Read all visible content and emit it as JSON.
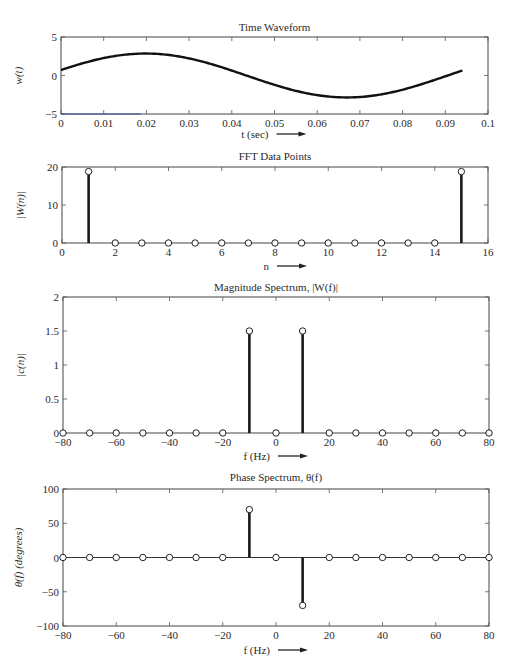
{
  "chart_data": [
    {
      "type": "line",
      "title": "Time Waveform",
      "xlabel": "t (sec)",
      "ylabel": "w(t)",
      "xlim": [
        0,
        0.1
      ],
      "ylim": [
        -5,
        5
      ],
      "xticks": [
        "0",
        "0.01",
        "0.02",
        "0.03",
        "0.04",
        "0.05",
        "0.06",
        "0.07",
        "0.08",
        "0.09",
        "0.1"
      ],
      "yticks": [
        "5",
        "0",
        "−5"
      ],
      "series": [
        {
          "name": "w(t)",
          "x": [
            0,
            0.005,
            0.01,
            0.015,
            0.02,
            0.025,
            0.03,
            0.035,
            0.04,
            0.045,
            0.05,
            0.055,
            0.06,
            0.065,
            0.07,
            0.075,
            0.08,
            0.085,
            0.09,
            0.094
          ],
          "values": [
            0.7,
            1.7,
            2.4,
            2.7,
            2.7,
            2.4,
            1.8,
            1.0,
            0.1,
            -0.8,
            -1.6,
            -2.3,
            -2.8,
            -3.0,
            -3.0,
            -2.8,
            -2.4,
            -1.7,
            -0.9,
            0.2
          ]
        }
      ],
      "grid": false
    },
    {
      "type": "stem",
      "title": "FFT Data Points",
      "xlabel": "n",
      "ylabel": "|W(n)|",
      "xlim": [
        0,
        16
      ],
      "ylim": [
        0,
        25
      ],
      "xticks": [
        "0",
        "2",
        "4",
        "6",
        "8",
        "10",
        "12",
        "14",
        "16"
      ],
      "yticks": [
        "20",
        "10",
        "0"
      ],
      "x": [
        1,
        2,
        3,
        4,
        5,
        6,
        7,
        8,
        9,
        10,
        11,
        12,
        13,
        14,
        15
      ],
      "values": [
        23.5,
        0,
        0,
        0,
        0,
        0,
        0,
        0,
        0,
        0,
        0,
        0,
        0,
        0,
        23.5
      ],
      "grid": false
    },
    {
      "type": "stem",
      "title": "Magnitude Spectrum, |W(f)|",
      "xlabel": "f (Hz)",
      "ylabel": "|c(n)|",
      "xlim": [
        -80,
        80
      ],
      "ylim": [
        0,
        2
      ],
      "xticks": [
        "−80",
        "−60",
        "−40",
        "−20",
        "0",
        "20",
        "40",
        "60",
        "80"
      ],
      "yticks": [
        "2",
        "1.5",
        "1",
        "0.5",
        "0"
      ],
      "x": [
        -80,
        -70,
        -60,
        -50,
        -40,
        -30,
        -20,
        -10,
        0,
        10,
        20,
        30,
        40,
        50,
        60,
        70,
        80
      ],
      "values": [
        0,
        0,
        0,
        0,
        0,
        0,
        0,
        1.5,
        0,
        1.5,
        0,
        0,
        0,
        0,
        0,
        0,
        0
      ],
      "grid": false
    },
    {
      "type": "stem",
      "title": "Phase Spectrum, θ(f)",
      "xlabel": "f (Hz)",
      "ylabel": "θ(f) (degrees)",
      "xlim": [
        -80,
        80
      ],
      "ylim": [
        -100,
        100
      ],
      "xticks": [
        "−80",
        "−60",
        "−40",
        "−20",
        "0",
        "20",
        "40",
        "60",
        "80"
      ],
      "yticks": [
        "100",
        "50",
        "0",
        "−50",
        "−100"
      ],
      "x": [
        -80,
        -70,
        -60,
        -50,
        -40,
        -30,
        -20,
        -10,
        0,
        10,
        20,
        30,
        40,
        50,
        60,
        70,
        80
      ],
      "values": [
        0,
        0,
        0,
        0,
        0,
        0,
        0,
        70,
        0,
        -70,
        0,
        0,
        0,
        0,
        0,
        0,
        0
      ],
      "grid": false
    }
  ],
  "labels": {
    "arrow": "→"
  }
}
